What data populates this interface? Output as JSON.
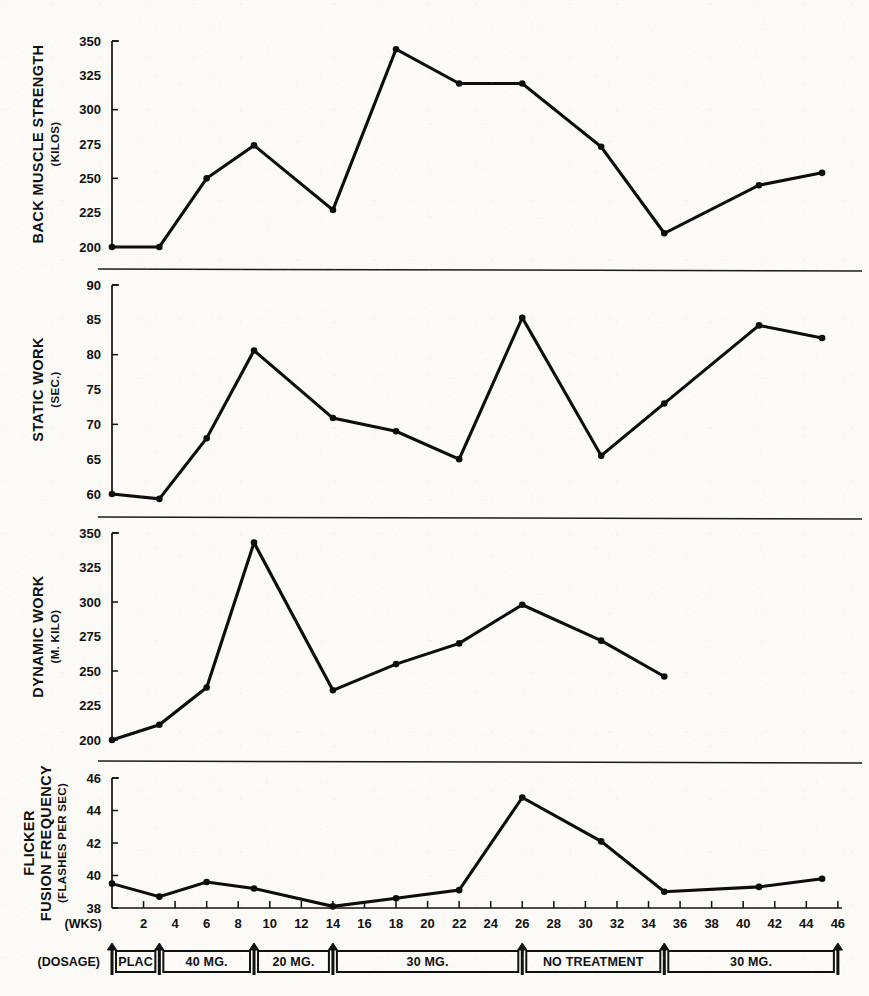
{
  "chart_data": {
    "type": "line",
    "title": "",
    "xlabel": "(WKS)",
    "x_ticks": [
      2,
      4,
      6,
      8,
      10,
      12,
      14,
      16,
      18,
      20,
      22,
      24,
      26,
      28,
      30,
      32,
      34,
      36,
      38,
      40,
      42,
      44,
      46
    ],
    "xlim": [
      0,
      47
    ],
    "grid": false,
    "legend": "none",
    "panels": [
      {
        "id": "back-muscle-strength",
        "ylabel": "BACK MUSCLE STRENGTH",
        "yunit": "(KILOS)",
        "ylim": [
          200,
          350
        ],
        "y_ticks": [
          200,
          225,
          250,
          275,
          300,
          325,
          350
        ],
        "x": [
          0,
          3,
          6,
          9,
          14,
          18,
          22,
          26,
          31,
          35,
          41,
          45
        ],
        "values": [
          200,
          200,
          250,
          274,
          227,
          344,
          319,
          319,
          273,
          210,
          245,
          254
        ]
      },
      {
        "id": "static-work",
        "ylabel": "STATIC WORK",
        "yunit": "(SEC.)",
        "ylim": [
          60,
          90
        ],
        "y_ticks": [
          60,
          65,
          70,
          75,
          80,
          85,
          90
        ],
        "x": [
          0,
          3,
          6,
          9,
          14,
          18,
          22,
          26,
          31,
          35,
          41,
          45
        ],
        "values": [
          60.0,
          59.3,
          68.0,
          80.6,
          70.9,
          69.0,
          65.0,
          85.3,
          65.5,
          73.0,
          84.2,
          82.4
        ]
      },
      {
        "id": "dynamic-work",
        "ylabel": "DYNAMIC WORK",
        "yunit": "(M. KILO)",
        "ylim": [
          200,
          350
        ],
        "y_ticks": [
          200,
          225,
          250,
          275,
          300,
          325,
          350
        ],
        "x": [
          0,
          3,
          6,
          9,
          14,
          18,
          22,
          26,
          31,
          35
        ],
        "values": [
          200,
          211,
          238,
          343,
          236,
          255,
          270,
          298,
          272,
          246
        ]
      },
      {
        "id": "flicker-fusion-frequency",
        "ylabel": "FLICKER FUSION FREQUENCY",
        "ylabel_line1": "FLICKER",
        "ylabel_line2": "FUSION FREQUENCY",
        "yunit": "(FLASHES PER SEC)",
        "ylim": [
          38,
          46
        ],
        "y_ticks": [
          38,
          40,
          42,
          44,
          46
        ],
        "x": [
          0,
          3,
          6,
          9,
          14,
          18,
          22,
          26,
          31,
          35,
          41,
          45
        ],
        "values": [
          39.5,
          38.7,
          39.6,
          39.2,
          38.1,
          38.6,
          39.1,
          44.8,
          42.1,
          39.0,
          39.3,
          39.8
        ]
      }
    ],
    "dosage_axis_label": "(DOSAGE)",
    "dosage_periods": [
      {
        "label": "PLAC",
        "start": 0,
        "end": 3
      },
      {
        "label": "40 MG.",
        "start": 3,
        "end": 9
      },
      {
        "label": "20 MG.",
        "start": 9,
        "end": 14
      },
      {
        "label": "30 MG.",
        "start": 14,
        "end": 26
      },
      {
        "label": "NO TREATMENT",
        "start": 26,
        "end": 35
      },
      {
        "label": "30 MG.",
        "start": 35,
        "end": 46
      }
    ],
    "dosage_arrows": [
      0,
      3,
      9,
      14,
      26,
      35,
      46
    ]
  },
  "colors": {
    "ink": "#0d0d0d",
    "paper": "#fbfaf7"
  }
}
